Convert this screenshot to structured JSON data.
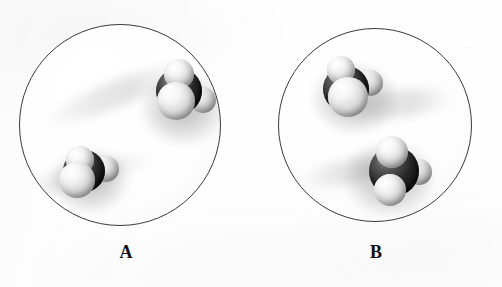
{
  "figure": {
    "type": "molecular-model-comparison",
    "background_color": "#fefefe",
    "panels": [
      {
        "id": "A",
        "label": "A",
        "label_x": 126,
        "label_y": 243,
        "circle": {
          "cx": 120,
          "cy": 125,
          "r": 101,
          "stroke": "#3a3a3a",
          "fill": "#fdfdfd"
        },
        "molecules": [
          {
            "name": "molecule-a-upper-right",
            "x": 178,
            "y": 90,
            "central_atom": {
              "color": "#101010",
              "r": 23
            },
            "outer_atoms": [
              {
                "dx": 0,
                "dy": -17,
                "r": 15,
                "color": "#e8e8e8"
              },
              {
                "dx": -3,
                "dy": 10,
                "r": 19,
                "color": "#ededed"
              },
              {
                "dx": 24,
                "dy": 9,
                "r": 13,
                "color": "#d7d7d7"
              }
            ]
          },
          {
            "name": "molecule-a-lower-left",
            "x": 83,
            "y": 170,
            "central_atom": {
              "color": "#101010",
              "r": 21
            },
            "outer_atoms": [
              {
                "dx": -4,
                "dy": -11,
                "r": 14,
                "color": "#e6e6e6"
              },
              {
                "dx": -7,
                "dy": 9,
                "r": 18,
                "color": "#ededed"
              },
              {
                "dx": 22,
                "dy": -2,
                "r": 13,
                "color": "#dcdcdc"
              }
            ]
          }
        ]
      },
      {
        "id": "B",
        "label": "B",
        "label_x": 376,
        "label_y": 243,
        "circle": {
          "cx": 375,
          "cy": 125,
          "r": 97,
          "stroke": "#3a3a3a",
          "fill": "#fdfdfd"
        },
        "molecules": [
          {
            "name": "molecule-b-upper-left",
            "x": 345,
            "y": 88,
            "central_atom": {
              "color": "#101010",
              "r": 23
            },
            "outer_atoms": [
              {
                "dx": -5,
                "dy": -19,
                "r": 14,
                "color": "#e8e8e8"
              },
              {
                "dx": 2,
                "dy": 8,
                "r": 20,
                "color": "#f0f0f0"
              },
              {
                "dx": 24,
                "dy": -6,
                "r": 13,
                "color": "#d9d9d9"
              }
            ]
          },
          {
            "name": "molecule-b-lower-right",
            "x": 393,
            "y": 170,
            "central_atom": {
              "color": "#101010",
              "r": 25
            },
            "outer_atoms": [
              {
                "dx": -2,
                "dy": -19,
                "r": 16,
                "color": "#ededed"
              },
              {
                "dx": -4,
                "dy": 19,
                "r": 16,
                "color": "#ebebeb"
              },
              {
                "dx": 25,
                "dy": 1,
                "r": 13,
                "color": "#dcdcdc"
              }
            ]
          }
        ]
      }
    ],
    "scan_artifact": {
      "text": "......",
      "x": 460,
      "y": 45
    }
  }
}
